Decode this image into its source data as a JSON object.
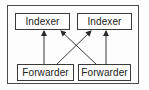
{
  "diagram": {
    "type": "flow",
    "colors": {
      "stroke": "#3a3a3a",
      "text": "#222222",
      "background": "#ffffff"
    },
    "nodes": [
      {
        "id": "indexer_left",
        "label": "Indexer",
        "row": "top",
        "position": "left"
      },
      {
        "id": "indexer_right",
        "label": "Indexer",
        "row": "top",
        "position": "right"
      },
      {
        "id": "forwarder_left",
        "label": "Forwarder",
        "row": "bottom",
        "position": "left"
      },
      {
        "id": "forwarder_right",
        "label": "Forwarder",
        "row": "bottom",
        "position": "right"
      }
    ],
    "edges": [
      {
        "from": "forwarder_left",
        "to": "indexer_left",
        "arrow": "end"
      },
      {
        "from": "forwarder_left",
        "to": "indexer_right",
        "arrow": "end"
      },
      {
        "from": "forwarder_right",
        "to": "indexer_left",
        "arrow": "end"
      },
      {
        "from": "forwarder_right",
        "to": "indexer_right",
        "arrow": "end"
      }
    ]
  }
}
